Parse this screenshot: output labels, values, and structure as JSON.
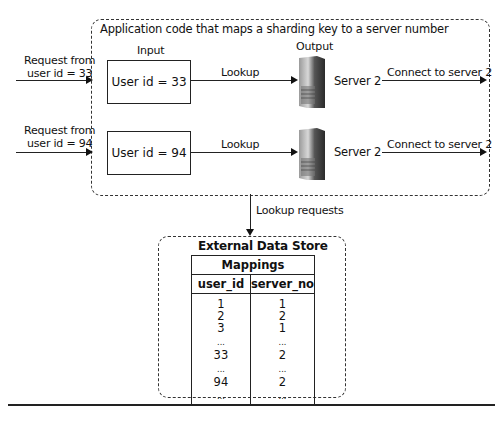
{
  "app_box": {
    "title": "Application code that maps a sharding key to a server number",
    "input_label": "Input",
    "output_label": "Output"
  },
  "requests": [
    {
      "label_line1": "Request from",
      "label_line2": "user id = 33",
      "input_box": "User id = 33",
      "lookup_label": "Lookup",
      "server_label": "Server 2",
      "connect_label": "Connect to server 2"
    },
    {
      "label_line1": "Request from",
      "label_line2": "user id = 94",
      "input_box": "User id = 94",
      "lookup_label": "Lookup",
      "server_label": "Server 2",
      "connect_label": "Connect to server 2"
    }
  ],
  "lookup_requests_label": "Lookup requests",
  "data_store": {
    "title": "External Data Store",
    "table_title": "Mappings",
    "columns": [
      "user_id",
      "server_no"
    ],
    "rows": [
      [
        "1",
        "1"
      ],
      [
        "2",
        "2"
      ],
      [
        "3",
        "1"
      ],
      [
        "...",
        "..."
      ],
      [
        "33",
        "2"
      ],
      [
        "...",
        "..."
      ],
      [
        "94",
        "2"
      ],
      [
        "...",
        "..."
      ]
    ]
  }
}
